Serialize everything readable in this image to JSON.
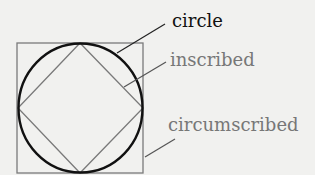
{
  "diagram": {
    "labels": {
      "circle": "circle",
      "inscribed": "inscribed",
      "circumscribed": "circumscribed"
    },
    "colors": {
      "background": "#f1f1ef",
      "circle": "#111111",
      "polygons": "#7a7a7a",
      "circle_label": "#111111",
      "gray_label": "#777777"
    }
  }
}
